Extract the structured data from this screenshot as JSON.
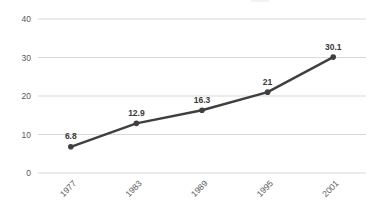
{
  "chart_data": {
    "type": "line",
    "categories": [
      "1977",
      "1983",
      "1989",
      "1995",
      "2001"
    ],
    "series": [
      {
        "name": "",
        "values": [
          6.8,
          12.9,
          16.3,
          21,
          30.1
        ]
      }
    ],
    "data_labels": [
      "6.8",
      "12.9",
      "16.3",
      "21",
      "30.1"
    ],
    "title": "",
    "xlabel": "",
    "ylabel": "",
    "ylim": [
      0,
      40
    ],
    "yticks": [
      0,
      10,
      20,
      30,
      40
    ],
    "grid": true,
    "legend_position": "none",
    "x_tick_rotation_deg": -45,
    "colors": {
      "line": "#3f3f3f",
      "marker": "#3f3f3f",
      "grid": "#d9d9d9",
      "tick_label": "#595959",
      "data_label": "#3a3a3a",
      "background": "#ffffff"
    }
  }
}
